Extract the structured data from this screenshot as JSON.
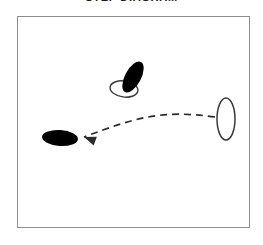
{
  "title": "STEP DIAGRAM",
  "frame": {
    "border_color": "#8e8e8e",
    "background_color": "#ffffff",
    "x": 17,
    "y": 16,
    "width": 233,
    "height": 212
  },
  "colors": {
    "filled_footprint": "#000000",
    "outline_footprint_stroke": "#3a3a3a",
    "outline_footprint_fill": "#ffffff",
    "arrow": "#2b2b2b",
    "frame_border": "#8e8e8e",
    "background": "#ffffff"
  },
  "figures": {
    "start_pair": {
      "label": "starting-foot-position",
      "filled_foot": {
        "name": "filled-footprint-start",
        "cx": 133,
        "cy": 77,
        "rx": 8,
        "ry": 17,
        "rotation_deg": 28
      },
      "outline_foot": {
        "name": "outline-footprint-start",
        "cx": 124,
        "cy": 89,
        "rx": 14,
        "ry": 8,
        "rotation_deg": 8
      }
    },
    "end_foot": {
      "label": "ending-foot-position",
      "name": "filled-footprint-end",
      "cx": 60,
      "cy": 138,
      "rx": 18,
      "ry": 8,
      "rotation_deg": 4
    },
    "reference_foot": {
      "label": "stationary-foot-position",
      "name": "outline-footprint-reference",
      "cx": 226,
      "cy": 119,
      "rx": 9,
      "ry": 21,
      "rotation_deg": 0
    },
    "motion_arrow": {
      "label": "movement-path",
      "name": "dashed-motion-arrow",
      "direction": "right-to-left",
      "style": "dashed-curve-with-arrowhead",
      "dash_pattern": "7 5",
      "start_x": 215,
      "start_y": 117,
      "end_x": 84,
      "end_y": 137,
      "arrowhead_angle_deg": 200
    }
  }
}
